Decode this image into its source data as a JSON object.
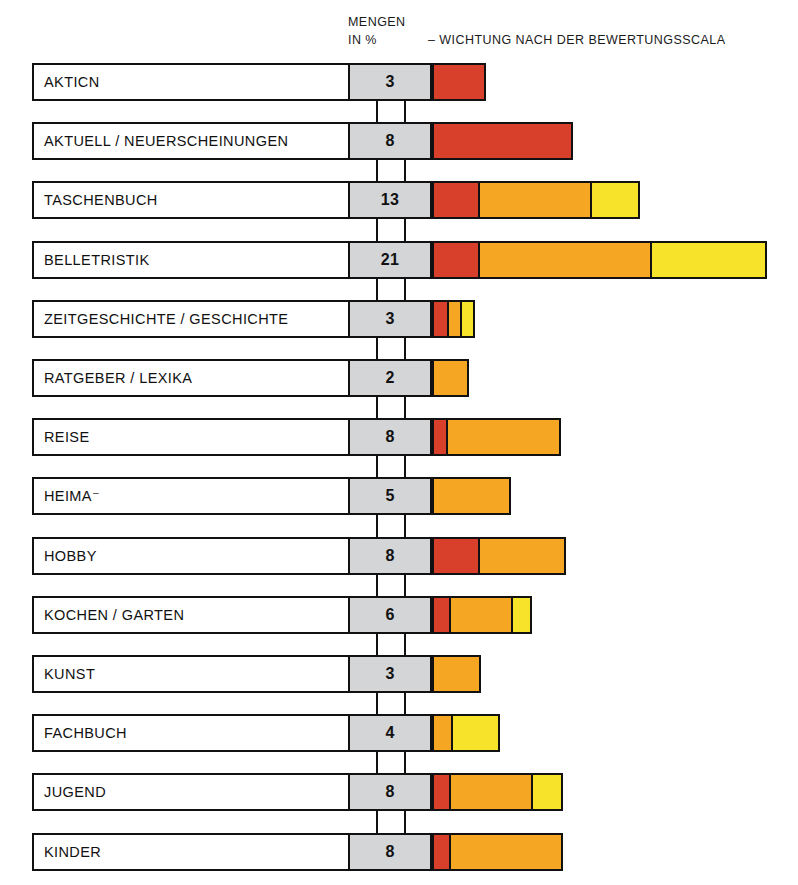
{
  "header": {
    "mengen": "MENGEN",
    "in_prozent": "IN %",
    "wichtung": "– WICHTUNG NACH DER BEWERTUNGSSCALA"
  },
  "colors": {
    "red": "#D8402B",
    "orange": "#F5A623",
    "yellow": "#F7E32A",
    "value_box": "#D3D5D7",
    "outline": "#111111",
    "background": "#FFFFFF"
  },
  "chart_data": {
    "type": "bar",
    "title": "MENGEN IN % – WICHTUNG NACH DER BEWERTUNGSSCALA",
    "subtitle": "",
    "xlabel": "",
    "ylabel": "",
    "orientation": "horizontal",
    "stacked": true,
    "grid": false,
    "legend": "none",
    "value_unit": "%",
    "value_column_header": "MENGEN IN %",
    "bar_column_header": "– WICHTUNG NACH DER BEWERTUNGSSCALA",
    "series": [
      {
        "name": "rot",
        "color": "#D8402B"
      },
      {
        "name": "orange",
        "color": "#F5A623"
      },
      {
        "name": "gelb",
        "color": "#F7E32A"
      }
    ],
    "categories": [
      "AKTICN",
      "AKTUELL / NEUERSCHEINUNGEN",
      "TASCHENBUCH",
      "BELLETRISTIK",
      "ZEITGESCHICHTE / GESCHICHTE",
      "RATGEBER / LEXIKA",
      "REISE",
      "HEIMA⁻",
      "HOBBY",
      "KOCHEN / GARTEN",
      "KUNST",
      "FACHBUCH",
      "JUGEND",
      "KINDER"
    ],
    "values": [
      3,
      8,
      13,
      21,
      3,
      2,
      8,
      5,
      8,
      6,
      3,
      4,
      8,
      8
    ],
    "segments": [
      {
        "red": 50,
        "orange": 0,
        "yellow": 0
      },
      {
        "red": 137,
        "orange": 0,
        "yellow": 0
      },
      {
        "red": 44,
        "orange": 112,
        "yellow": 48
      },
      {
        "red": 44,
        "orange": 172,
        "yellow": 115
      },
      {
        "red": 13,
        "orange": 13,
        "yellow": 13
      },
      {
        "red": 0,
        "orange": 33,
        "yellow": 0
      },
      {
        "red": 12,
        "orange": 113,
        "yellow": 0
      },
      {
        "red": 0,
        "orange": 75,
        "yellow": 0
      },
      {
        "red": 44,
        "orange": 86,
        "yellow": 0
      },
      {
        "red": 15,
        "orange": 62,
        "yellow": 19
      },
      {
        "red": 0,
        "orange": 45,
        "yellow": 0
      },
      {
        "red": 0,
        "orange": 17,
        "yellow": 47
      },
      {
        "red": 15,
        "orange": 82,
        "yellow": 30
      },
      {
        "red": 15,
        "orange": 112,
        "yellow": 0
      }
    ]
  },
  "rows": [
    {
      "label": "AKTICN",
      "value": "3"
    },
    {
      "label": "AKTUELL / NEUERSCHEINUNGEN",
      "value": "8"
    },
    {
      "label": "TASCHENBUCH",
      "value": "13"
    },
    {
      "label": "BELLETRISTIK",
      "value": "21"
    },
    {
      "label": "ZEITGESCHICHTE / GESCHICHTE",
      "value": "3"
    },
    {
      "label": "RATGEBER / LEXIKA",
      "value": "2"
    },
    {
      "label": "REISE",
      "value": "8"
    },
    {
      "label": "HEIMA⁻",
      "value": "5"
    },
    {
      "label": "HOBBY",
      "value": "8"
    },
    {
      "label": "KOCHEN / GARTEN",
      "value": "6"
    },
    {
      "label": "KUNST",
      "value": "3"
    },
    {
      "label": "FACHBUCH",
      "value": "4"
    },
    {
      "label": "JUGEND",
      "value": "8"
    },
    {
      "label": "KINDER",
      "value": "8"
    }
  ]
}
